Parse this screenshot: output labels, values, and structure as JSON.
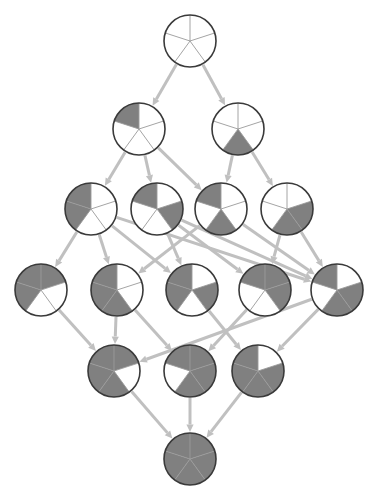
{
  "figure": {
    "type": "hasse-diagram",
    "title": "",
    "background_color": "#ffffff",
    "node_shape": "pie-chart",
    "sectors_per_node": 5,
    "sector_start_angle_deg": -90,
    "colors": {
      "filled_sector": "#808080",
      "empty_sector": "#ffffff",
      "node_outline": "#3a3a3a",
      "spoke_line": "#9a9a9a",
      "edge": "#c0c0c0",
      "arrowhead": "#c0c0c0"
    },
    "node_radius": 26,
    "node_outline_width": 1.6,
    "edge_width": 3.0
  },
  "levels": [
    {
      "index": 0,
      "y": 41,
      "filled_count": 0,
      "node_count": 1
    },
    {
      "index": 1,
      "y": 129,
      "filled_count": 1,
      "node_count": 2
    },
    {
      "index": 2,
      "y": 209,
      "filled_count": 2,
      "node_count": 4
    },
    {
      "index": 3,
      "y": 290,
      "filled_count": 3,
      "node_count": 5
    },
    {
      "index": 4,
      "y": 371,
      "filled_count": 4,
      "node_count": 3
    },
    {
      "index": 5,
      "y": 459,
      "filled_count": 5,
      "node_count": 1
    }
  ],
  "nodes": [
    {
      "id": "n0",
      "level": 0,
      "x": 190,
      "y": 41,
      "sectors": [
        0,
        0,
        0,
        0,
        0
      ],
      "filled_count": 0,
      "label": "empty-pie"
    },
    {
      "id": "n1a",
      "level": 1,
      "x": 139,
      "y": 129,
      "sectors": [
        0,
        0,
        0,
        0,
        1
      ],
      "filled_count": 1,
      "label": "one-sector-upper-left"
    },
    {
      "id": "n1b",
      "level": 1,
      "x": 238,
      "y": 129,
      "sectors": [
        0,
        0,
        1,
        0,
        0
      ],
      "filled_count": 1,
      "label": "one-sector-lower-right"
    },
    {
      "id": "n2a",
      "level": 2,
      "x": 91,
      "y": 209,
      "sectors": [
        0,
        0,
        0,
        1,
        1
      ],
      "filled_count": 2,
      "label": "two-adjacent-left"
    },
    {
      "id": "n2b",
      "level": 2,
      "x": 157,
      "y": 209,
      "sectors": [
        0,
        1,
        0,
        0,
        1
      ],
      "filled_count": 2,
      "label": "two-upper-pair"
    },
    {
      "id": "n2c",
      "level": 2,
      "x": 221,
      "y": 209,
      "sectors": [
        0,
        0,
        1,
        0,
        1
      ],
      "filled_count": 2,
      "label": "two-opposite"
    },
    {
      "id": "n2d",
      "level": 2,
      "x": 287,
      "y": 209,
      "sectors": [
        0,
        1,
        1,
        0,
        0
      ],
      "filled_count": 2,
      "label": "two-adjacent-right"
    },
    {
      "id": "n3a",
      "level": 3,
      "x": 41,
      "y": 290,
      "sectors": [
        1,
        0,
        0,
        1,
        1
      ],
      "filled_count": 3,
      "label": "three-consecutive-left"
    },
    {
      "id": "n3b",
      "level": 3,
      "x": 117,
      "y": 290,
      "sectors": [
        0,
        0,
        1,
        1,
        1
      ],
      "filled_count": 3,
      "label": "three-lower-left-run"
    },
    {
      "id": "n3c",
      "level": 3,
      "x": 192,
      "y": 290,
      "sectors": [
        0,
        1,
        0,
        1,
        1
      ],
      "filled_count": 3,
      "label": "three-split-a"
    },
    {
      "id": "n3d",
      "level": 3,
      "x": 265,
      "y": 290,
      "sectors": [
        1,
        1,
        0,
        0,
        1
      ],
      "filled_count": 3,
      "label": "three-top-run"
    },
    {
      "id": "n3e",
      "level": 3,
      "x": 337,
      "y": 290,
      "sectors": [
        0,
        1,
        1,
        0,
        1
      ],
      "filled_count": 3,
      "label": "three-split-b"
    },
    {
      "id": "n4a",
      "level": 4,
      "x": 114,
      "y": 371,
      "sectors": [
        1,
        0,
        1,
        1,
        1
      ],
      "filled_count": 4,
      "label": "four-missing-upper-right"
    },
    {
      "id": "n4b",
      "level": 4,
      "x": 190,
      "y": 371,
      "sectors": [
        1,
        1,
        1,
        0,
        1
      ],
      "filled_count": 4,
      "label": "four-missing-lower-left"
    },
    {
      "id": "n4c",
      "level": 4,
      "x": 258,
      "y": 371,
      "sectors": [
        0,
        1,
        1,
        1,
        1
      ],
      "filled_count": 4,
      "label": "four-missing-top"
    },
    {
      "id": "n5",
      "level": 5,
      "x": 190,
      "y": 459,
      "sectors": [
        1,
        1,
        1,
        1,
        1
      ],
      "filled_count": 5,
      "label": "full-pie"
    }
  ],
  "edges": [
    {
      "from": "n0",
      "to": "n1a"
    },
    {
      "from": "n0",
      "to": "n1b"
    },
    {
      "from": "n1a",
      "to": "n2a"
    },
    {
      "from": "n1a",
      "to": "n2b"
    },
    {
      "from": "n1a",
      "to": "n2c"
    },
    {
      "from": "n1b",
      "to": "n2c"
    },
    {
      "from": "n1b",
      "to": "n2d"
    },
    {
      "from": "n2a",
      "to": "n3a"
    },
    {
      "from": "n2a",
      "to": "n3b"
    },
    {
      "from": "n2a",
      "to": "n3c"
    },
    {
      "from": "n2a",
      "to": "n3e"
    },
    {
      "from": "n2b",
      "to": "n3c"
    },
    {
      "from": "n2b",
      "to": "n3d"
    },
    {
      "from": "n2b",
      "to": "n3e"
    },
    {
      "from": "n2c",
      "to": "n3b"
    },
    {
      "from": "n2c",
      "to": "n3e"
    },
    {
      "from": "n2d",
      "to": "n3d"
    },
    {
      "from": "n2d",
      "to": "n3e"
    },
    {
      "from": "n3a",
      "to": "n4a"
    },
    {
      "from": "n3b",
      "to": "n4a"
    },
    {
      "from": "n3b",
      "to": "n4b"
    },
    {
      "from": "n3c",
      "to": "n4c"
    },
    {
      "from": "n3d",
      "to": "n4b"
    },
    {
      "from": "n3e",
      "to": "n4a"
    },
    {
      "from": "n3e",
      "to": "n4c"
    },
    {
      "from": "n4a",
      "to": "n5"
    },
    {
      "from": "n4b",
      "to": "n5"
    },
    {
      "from": "n4c",
      "to": "n5"
    }
  ]
}
